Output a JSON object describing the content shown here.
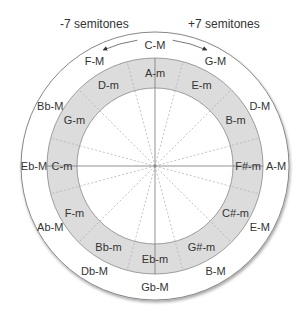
{
  "diagram": {
    "header_left": "-7 semitones",
    "header_right": "+7 semitones",
    "colors": {
      "ring_fill": "#dcdcdc",
      "outer_fill": "#ffffff",
      "stroke": "#888888",
      "spoke": "#999999",
      "text": "#333333"
    },
    "major_keys": [
      "C-M",
      "G-M",
      "D-M",
      "A-M",
      "E-M",
      "B-M",
      "Gb-M",
      "Db-M",
      "Ab-M",
      "Eb-M",
      "Bb-M",
      "F-M"
    ],
    "minor_keys": [
      "A-m",
      "E-m",
      "B-m",
      "F#-m",
      "C#-m",
      "G#-m",
      "Eb-m",
      "Bb-m",
      "F-m",
      "C-m",
      "G-m",
      "D-m"
    ],
    "arrows": [
      {
        "from": "C-M",
        "to": "F-M",
        "label": "-7 semitones"
      },
      {
        "from": "C-M",
        "to": "G-M",
        "label": "+7 semitones"
      }
    ]
  }
}
